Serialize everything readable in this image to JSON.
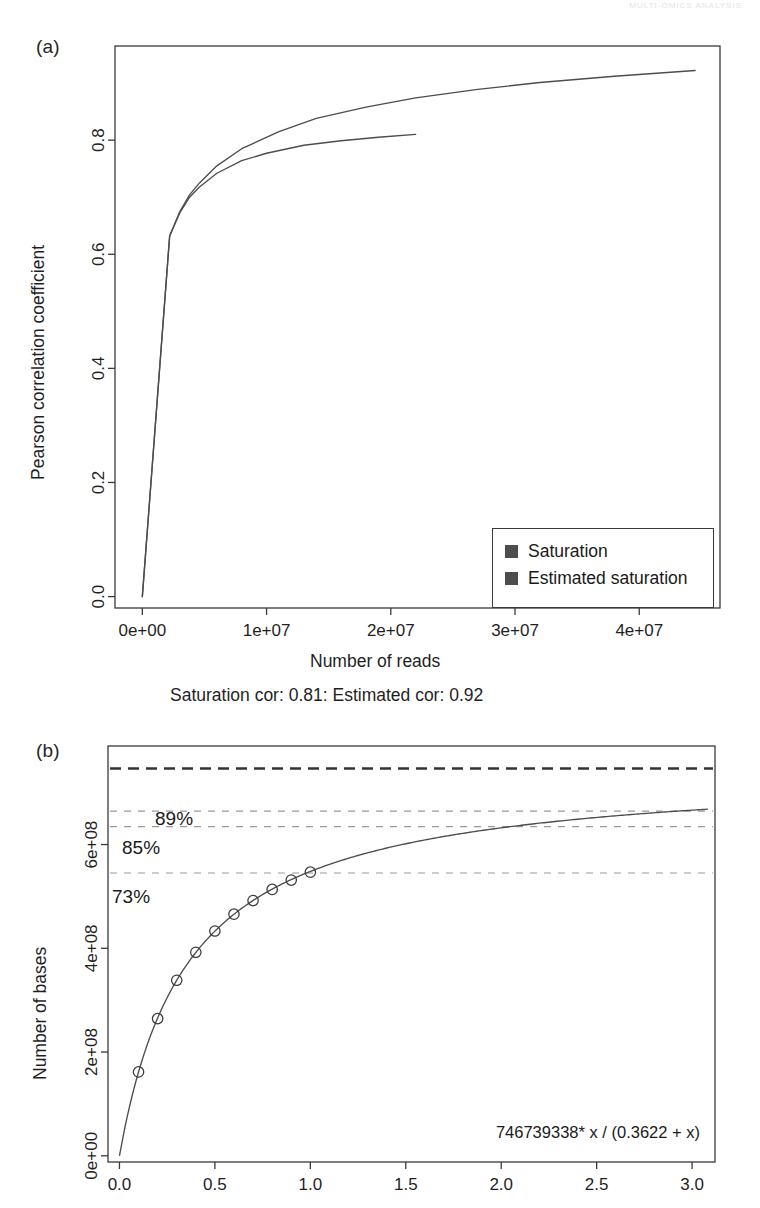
{
  "figure": {
    "top_edge_fragment": "MULTI-OMICS ANALYSIS",
    "background_color": "#ffffff",
    "line_color": "#3a3a3a",
    "dash_color": "#9a9a9a"
  },
  "panel_a": {
    "letter": "(a)",
    "caption": "Saturation cor: 0.81: Estimated cor: 0.92",
    "legend": {
      "items": [
        {
          "label": "Saturation",
          "color": "#4d4d4d"
        },
        {
          "label": "Estimated saturation",
          "color": "#4d4d4d"
        }
      ]
    },
    "chart_data": {
      "type": "line",
      "title": "",
      "xlabel": "Number of reads",
      "ylabel": "Pearson correlation coefficient",
      "xlim": [
        -2200000,
        46500000
      ],
      "ylim": [
        -0.02,
        0.965
      ],
      "xticks": [
        0,
        10000000,
        20000000,
        30000000,
        40000000
      ],
      "xticklabels": [
        "0e+00",
        "1e+07",
        "2e+07",
        "3e+07",
        "4e+07"
      ],
      "yticks": [
        0.0,
        0.2,
        0.4,
        0.6,
        0.8
      ],
      "yticklabels": [
        "0.0",
        "0.2",
        "0.4",
        "0.6",
        "0.8"
      ],
      "grid": false,
      "legend_position": "bottom-right",
      "series": [
        {
          "name": "Saturation",
          "color": "#4d4d4d",
          "x": [
            0,
            2200000,
            3000000,
            3800000,
            4600000,
            6000000,
            8000000,
            10000000,
            13000000,
            16000000,
            19000000,
            22000000
          ],
          "y": [
            0.0,
            0.632,
            0.672,
            0.7,
            0.718,
            0.742,
            0.764,
            0.777,
            0.791,
            0.799,
            0.805,
            0.81
          ]
        },
        {
          "name": "Estimated saturation",
          "color": "#4d4d4d",
          "x": [
            0,
            2200000,
            3000000,
            3800000,
            4600000,
            6000000,
            8000000,
            11000000,
            14000000,
            18000000,
            22000000,
            27000000,
            32000000,
            38000000,
            44500000
          ],
          "y": [
            0.0,
            0.632,
            0.674,
            0.704,
            0.725,
            0.755,
            0.785,
            0.815,
            0.838,
            0.858,
            0.874,
            0.889,
            0.901,
            0.912,
            0.922
          ]
        }
      ]
    }
  },
  "panel_b": {
    "letter": "(b)",
    "formula": "746739338* x / (0.3622 + x)",
    "chart_data": {
      "type": "line",
      "title": "",
      "xlabel": "",
      "ylabel": "Number of bases",
      "xlim": [
        -0.06,
        3.12
      ],
      "ylim": [
        -12000000,
        790000000
      ],
      "xticks": [
        0.0,
        0.5,
        1.0,
        1.5,
        2.0,
        2.5,
        3.0
      ],
      "xticklabels": [
        "0.0",
        "0.5",
        "1.0",
        "1.5",
        "2.0",
        "2.5",
        "3.0"
      ],
      "yticks": [
        0,
        200000000,
        400000000,
        600000000
      ],
      "yticklabels": [
        "0e+00",
        "2e+08",
        "4e+08",
        "6e+08"
      ],
      "grid": false,
      "model": {
        "vmax": 746739338,
        "km": 0.3622,
        "expression": "746739338 * x / (0.3622 + x)"
      },
      "hlines": [
        {
          "label": "",
          "value": 746739338,
          "style": "dashed-bold",
          "color": "#333333"
        },
        {
          "label": "89%",
          "value": 664598010,
          "style": "dashed",
          "color": "#9a9a9a"
        },
        {
          "label": "85%",
          "value": 634728437,
          "style": "dashed",
          "color": "#9a9a9a"
        },
        {
          "label": "73%",
          "value": 545119717,
          "style": "dashed",
          "color": "#9a9a9a"
        }
      ],
      "points": {
        "name": "Observed",
        "marker": "circle-open",
        "x": [
          0.1,
          0.2,
          0.3,
          0.4,
          0.5,
          0.6,
          0.7,
          0.8,
          0.9,
          1.0
        ],
        "y": [
          161700000,
          264400000,
          338300000,
          392300000,
          433300000,
          465800000,
          492000000,
          513500000,
          531500000,
          546800000
        ]
      },
      "curve": {
        "name": "Fitted Michaelis-Menten curve",
        "color": "#4d4d4d"
      }
    }
  }
}
